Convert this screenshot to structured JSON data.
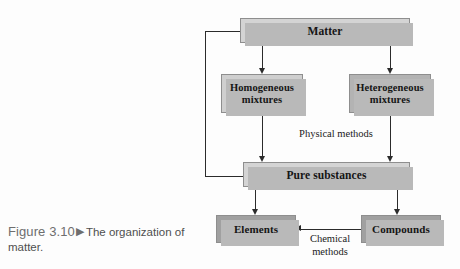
{
  "figure": {
    "number": "Figure 3.10",
    "marker": "▶",
    "caption": "The organization of matter."
  },
  "diagram": {
    "title": "The organization of matter",
    "nodes": [
      {
        "id": "matter",
        "label": "Matter",
        "tone": "#d4d4d4"
      },
      {
        "id": "homogeneous",
        "label": "Homogeneous\nmixtures",
        "tone": "#cfcfcf"
      },
      {
        "id": "heterogeneous",
        "label": "Heterogeneous\nmixtures",
        "tone": "#b3b3b3"
      },
      {
        "id": "pure",
        "label": "Pure substances",
        "tone": "#d4d4d4"
      },
      {
        "id": "elements",
        "label": "Elements",
        "tone": "#a0a0a0"
      },
      {
        "id": "compounds",
        "label": "Compounds",
        "tone": "#a0a0a0"
      }
    ],
    "edge_labels": [
      {
        "id": "physical",
        "text": "Physical methods"
      },
      {
        "id": "chemical",
        "text": "Chemical\nmethods"
      }
    ],
    "edges": [
      {
        "from": "matter",
        "to": "homogeneous",
        "label": ""
      },
      {
        "from": "matter",
        "to": "heterogeneous",
        "label": ""
      },
      {
        "from": "homogeneous",
        "to": "pure",
        "label": "Physical methods"
      },
      {
        "from": "heterogeneous",
        "to": "pure",
        "label": "Physical methods"
      },
      {
        "from": "pure",
        "to": "elements",
        "label": ""
      },
      {
        "from": "pure",
        "to": "compounds",
        "label": ""
      },
      {
        "from": "compounds",
        "to": "elements",
        "label": "Chemical methods"
      },
      {
        "from": "pure",
        "to": "matter",
        "label": ""
      }
    ],
    "colors": {
      "line": "#2b2b2b",
      "shadow": "#b9b9b9",
      "border": "#8e8e8e",
      "caption_text": "#5d5d5d"
    }
  }
}
